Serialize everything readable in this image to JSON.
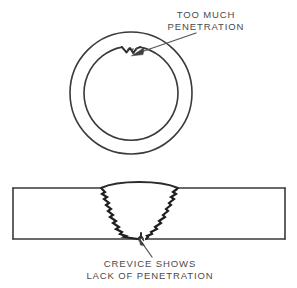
{
  "figure": {
    "background_color": "#ffffff",
    "ink_color": "#3a3a3a",
    "text_color": "#4a4a4a",
    "width": 297,
    "height": 288
  },
  "callouts": {
    "top": {
      "line1": "TOO MUCH",
      "line2": "PENETRATION",
      "anchor_x": 206,
      "line1_y": 15,
      "line2_y": 27
    },
    "bottom": {
      "line1": "CREVICE SHOWS",
      "line2": "LACK OF PENETRATION",
      "anchor_x": 150,
      "line1_y": 264,
      "line2_y": 276
    }
  },
  "pipe_view": {
    "label": "pipe-cross-section",
    "outer_circle": {
      "cx": 131,
      "cy": 93,
      "r": 61
    },
    "inner_circle": {
      "cx": 131,
      "cy": 93,
      "r": 47
    },
    "defect": "excess-root-penetration-bump",
    "defect_angle_deg": -90
  },
  "plate_view": {
    "label": "plate-v-groove-weld-section",
    "plate_left": 13,
    "plate_right": 285,
    "plate_top": 188,
    "plate_bottom": 239,
    "weld_crown_left_x": 101,
    "weld_crown_right_x": 178,
    "weld_root_x": 142,
    "defect": "root-crevice-lack-of-penetration"
  },
  "leaders": [
    {
      "name": "top-leader",
      "from_x": 196,
      "from_y": 33,
      "to_x": 136,
      "to_y": 53
    },
    {
      "name": "bottom-leader",
      "from_x": 152,
      "from_y": 257,
      "to_x": 140,
      "to_y": 240
    }
  ]
}
